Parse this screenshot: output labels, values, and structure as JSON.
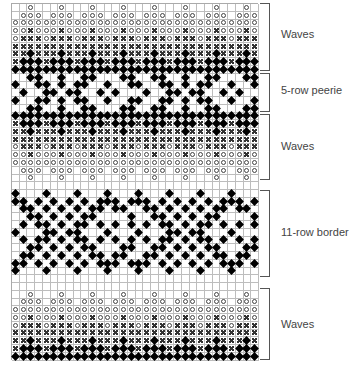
{
  "chart_title": "",
  "grid": {
    "columns": 32,
    "rows": 46,
    "stitch_symbols": {
      "o": "open-circle",
      "x": "cross",
      "d": "filled-diamond",
      ".": "blank"
    }
  },
  "sections": [
    {
      "label": "Waves",
      "top": 3,
      "height": 68,
      "label_y": 28
    },
    {
      "label": "5-row peerie",
      "top": 73,
      "height": 39,
      "label_y": 84
    },
    {
      "label": "Waves",
      "top": 114,
      "height": 66,
      "label_y": 140
    },
    {
      "label": "11-row border",
      "top": 190,
      "height": 87,
      "label_y": 226
    },
    {
      "label": "Waves",
      "top": 288,
      "height": 72,
      "label_y": 318
    }
  ],
  "patterns": {
    "period4": {
      "o_top": "..o.",
      "o_mid": ".ooo",
      "o_all": "oooo",
      "o_x": "ooxo",
      "x_o": "oxxx",
      "x_all": "xxxx",
      "x_d": "xxdx",
      "d_x": "xddd",
      "d_all": "dddd",
      "blank": "...."
    },
    "period16": {
      "p0": [
        2,
        3,
        6,
        9,
        10,
        14,
        15
      ],
      "p1": [
        0,
        3,
        4,
        6,
        8,
        9,
        12,
        15
      ],
      "p2": [
        1,
        4,
        5,
        7,
        8,
        11,
        13
      ],
      "b0": [
        0,
        4,
        8,
        12
      ],
      "b1": [
        0,
        1,
        3,
        5,
        7,
        9,
        11,
        12,
        13,
        15
      ],
      "b2": [
        1,
        2,
        4,
        6,
        8,
        10,
        11,
        13,
        14
      ],
      "b3": [
        2,
        3,
        5,
        7,
        9,
        10,
        15
      ],
      "b4": [
        1,
        3,
        4,
        6,
        8,
        9,
        11,
        13,
        15
      ],
      "b5": [
        0,
        4,
        5,
        7,
        8,
        12
      ],
      "b7": [
        2,
        3,
        5,
        7,
        9,
        10,
        14,
        15
      ]
    }
  },
  "row_sequence": [
    "o_top",
    "o_mid",
    "o_all",
    "o_x",
    "x_o",
    "x_all",
    "x_d",
    "d_x",
    "d_all",
    "p0",
    "p1",
    "p2",
    "p1",
    "p0",
    "d_all",
    "d_x",
    "x_d",
    "x_all",
    "x_o",
    "o_x",
    "o_all",
    "o_mid",
    "o_top",
    "blank",
    "b0",
    "b1",
    "b2",
    "b3",
    "b4",
    "b5",
    "b4",
    "b7",
    "b2",
    "b1",
    "b0",
    "blank",
    "blank",
    "o_top",
    "o_mid",
    "o_all",
    "o_x",
    "x_o",
    "x_all",
    "x_d",
    "d_x",
    "d_all"
  ]
}
